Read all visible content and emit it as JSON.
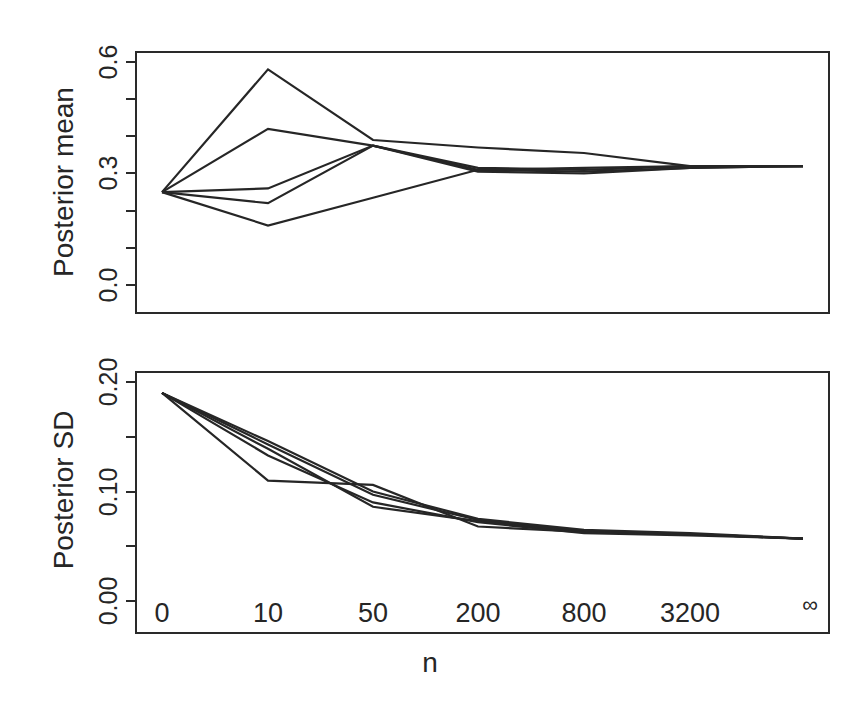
{
  "chart_data": [
    {
      "type": "line",
      "panel": "top",
      "ylabel": "Posterior mean",
      "xlabel": "",
      "ylim": [
        -0.07,
        0.62
      ],
      "yticks": [
        0.0,
        0.1,
        0.2,
        0.3,
        0.4,
        0.5,
        0.6
      ],
      "ytick_labels": [
        "0.0",
        "0.3",
        "0.6"
      ],
      "grid": false,
      "x": [
        "0",
        "10",
        "50",
        "200",
        "800",
        "3200",
        "∞"
      ],
      "series": [
        {
          "name": "run 1",
          "values": [
            0.25,
            0.58,
            0.39,
            0.37,
            0.355,
            0.32,
            0.32
          ]
        },
        {
          "name": "run 2",
          "values": [
            0.25,
            0.42,
            0.375,
            0.315,
            0.31,
            0.32,
            0.32
          ]
        },
        {
          "name": "run 3",
          "values": [
            0.25,
            0.26,
            0.375,
            0.31,
            0.305,
            0.315,
            0.32
          ]
        },
        {
          "name": "run 4",
          "values": [
            0.25,
            0.22,
            0.375,
            0.305,
            0.3,
            0.315,
            0.32
          ]
        },
        {
          "name": "run 5",
          "values": [
            0.25,
            0.16,
            0.235,
            0.31,
            0.315,
            0.32,
            0.32
          ]
        }
      ]
    },
    {
      "type": "line",
      "panel": "bottom",
      "ylabel": "Posterior SD",
      "xlabel": "n",
      "ylim": [
        -0.03,
        0.21
      ],
      "yticks": [
        0.0,
        0.05,
        0.1,
        0.15,
        0.2
      ],
      "ytick_labels": [
        "0.00",
        "0.10",
        "0.20"
      ],
      "grid": false,
      "x": [
        "0",
        "10",
        "50",
        "200",
        "800",
        "3200",
        "∞"
      ],
      "series": [
        {
          "name": "run 1",
          "values": [
            0.19,
            0.11,
            0.106,
            0.068,
            0.063,
            0.061,
            0.057
          ]
        },
        {
          "name": "run 2",
          "values": [
            0.19,
            0.133,
            0.09,
            0.072,
            0.062,
            0.06,
            0.057
          ]
        },
        {
          "name": "run 3",
          "values": [
            0.19,
            0.139,
            0.086,
            0.073,
            0.063,
            0.061,
            0.057
          ]
        },
        {
          "name": "run 4",
          "values": [
            0.19,
            0.143,
            0.097,
            0.074,
            0.064,
            0.061,
            0.057
          ]
        },
        {
          "name": "run 5",
          "values": [
            0.19,
            0.146,
            0.1,
            0.075,
            0.065,
            0.062,
            0.057
          ]
        }
      ]
    }
  ],
  "figure": {
    "top": {
      "ylabel": "Posterior mean",
      "ytick_labels": [
        "0.0",
        "0.3",
        "0.6"
      ]
    },
    "bottom": {
      "ylabel": "Posterior SD",
      "ytick_labels": [
        "0.00",
        "0.10",
        "0.20"
      ]
    },
    "xtick_labels": [
      "0",
      "10",
      "50",
      "200",
      "800",
      "3200",
      "∞"
    ],
    "xlabel": "n"
  }
}
